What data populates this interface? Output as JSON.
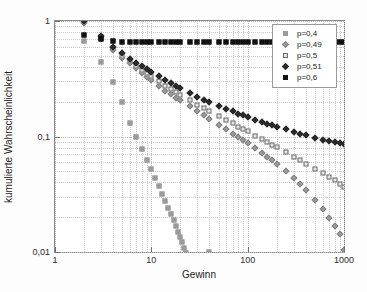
{
  "chart_data": {
    "type": "scatter",
    "title": "",
    "xlabel": "Gewinn",
    "ylabel": "kumulierte Wahrscheinlichkeit",
    "xscale": "log",
    "yscale": "log",
    "xlim": [
      1,
      1000
    ],
    "ylim": [
      0.01,
      1
    ],
    "grid": true,
    "legend_position": "top-right",
    "xticks": [
      "1",
      "10",
      "100",
      "1000"
    ],
    "xtick_values": [
      1,
      10,
      100,
      1000
    ],
    "yticks": [
      "1",
      "0,1",
      "0,01"
    ],
    "ytick_values": [
      1,
      0.1,
      0.01
    ],
    "series": [
      {
        "name": "p=0,4",
        "marker": "square",
        "color": "#9a9a9a",
        "fill": "#9a9a9a",
        "x": [
          2,
          3,
          4,
          5,
          6,
          7,
          8,
          9,
          10,
          11,
          12,
          13,
          14,
          15,
          16,
          17,
          18,
          19,
          20,
          21,
          22,
          23,
          24,
          25,
          26,
          27,
          28,
          29,
          30,
          31,
          32,
          33,
          34,
          35,
          36,
          37,
          38,
          39,
          40
        ],
        "y": [
          0.667,
          0.444,
          0.296,
          0.198,
          0.132,
          0.1,
          0.078,
          0.063,
          0.052,
          0.0437,
          0.0372,
          0.032,
          0.0277,
          0.0242,
          0.0213,
          0.0188,
          0.0167,
          0.0149,
          0.0134,
          0.0121,
          0.0109,
          0.00985,
          0.00893,
          0.00811,
          0.00738,
          0.00672,
          0.00613,
          0.0056,
          0.00512,
          0.00469,
          0.0043,
          0.00394,
          0.00362,
          0.00333,
          0.00306,
          0.00282,
          0.0026,
          0.0024,
          0.01
        ]
      },
      {
        "name": "p=0,49",
        "marker": "diamond",
        "color": "#808080",
        "fill": "#9d9d9d",
        "x": [
          2,
          3,
          4,
          5,
          6,
          7,
          8,
          9,
          10,
          12,
          14,
          16,
          18,
          20,
          25,
          30,
          35,
          40,
          50,
          60,
          70,
          80,
          90,
          100,
          120,
          140,
          160,
          180,
          200,
          250,
          300,
          350,
          400,
          500,
          600,
          700,
          800,
          900,
          1000
        ],
        "y": [
          0.96,
          0.7,
          0.56,
          0.48,
          0.43,
          0.39,
          0.355,
          0.33,
          0.31,
          0.275,
          0.25,
          0.232,
          0.217,
          0.205,
          0.182,
          0.165,
          0.153,
          0.143,
          0.127,
          0.115,
          0.106,
          0.099,
          0.093,
          0.088,
          0.079,
          0.072,
          0.066,
          0.062,
          0.058,
          0.05,
          0.0435,
          0.0385,
          0.0345,
          0.028,
          0.0235,
          0.0198,
          0.0168,
          0.0143,
          0.0105
        ]
      },
      {
        "name": "p=0,5",
        "marker": "square",
        "color": "#6d6d6d",
        "fill": "#e6e6e6",
        "x": [
          2,
          3,
          4,
          5,
          6,
          7,
          8,
          9,
          10,
          12,
          14,
          16,
          18,
          20,
          25,
          30,
          35,
          40,
          50,
          60,
          70,
          80,
          90,
          100,
          120,
          140,
          160,
          180,
          200,
          250,
          300,
          350,
          400,
          500,
          600,
          700,
          800,
          900,
          1000
        ],
        "y": [
          1.0,
          0.72,
          0.58,
          0.5,
          0.448,
          0.41,
          0.378,
          0.353,
          0.333,
          0.3,
          0.275,
          0.257,
          0.242,
          0.229,
          0.205,
          0.188,
          0.176,
          0.166,
          0.15,
          0.139,
          0.13,
          0.122,
          0.116,
          0.111,
          0.102,
          0.095,
          0.09,
          0.085,
          0.081,
          0.073,
          0.067,
          0.062,
          0.058,
          0.052,
          0.048,
          0.045,
          0.042,
          0.039,
          0.0365
        ]
      },
      {
        "name": "p=0,51",
        "marker": "diamond",
        "color": "#2a2a2a",
        "fill": "#2a2a2a",
        "x": [
          2,
          3,
          4,
          5,
          6,
          7,
          8,
          9,
          10,
          12,
          14,
          16,
          18,
          20,
          25,
          30,
          35,
          40,
          50,
          60,
          70,
          80,
          90,
          100,
          120,
          140,
          160,
          180,
          200,
          250,
          300,
          350,
          400,
          500,
          600,
          700,
          800,
          900,
          1000
        ],
        "y": [
          1.0,
          0.735,
          0.6,
          0.525,
          0.472,
          0.435,
          0.405,
          0.382,
          0.362,
          0.331,
          0.307,
          0.289,
          0.274,
          0.262,
          0.238,
          0.221,
          0.209,
          0.199,
          0.184,
          0.173,
          0.165,
          0.158,
          0.153,
          0.148,
          0.14,
          0.134,
          0.129,
          0.125,
          0.122,
          0.115,
          0.11,
          0.106,
          0.103,
          0.098,
          0.094,
          0.092,
          0.089,
          0.087,
          0.0855
        ]
      },
      {
        "name": "p=0,6",
        "marker": "square",
        "color": "#111111",
        "fill": "#111111",
        "x": [
          2,
          3,
          4,
          5,
          6,
          7,
          8,
          9,
          10,
          12,
          14,
          16,
          18,
          20,
          25,
          30,
          35,
          40,
          50,
          60,
          70,
          80,
          90,
          100,
          120,
          140,
          160,
          180,
          200,
          250,
          300,
          350,
          400,
          500,
          600,
          700,
          800,
          900,
          1000
        ],
        "y": [
          0.75,
          0.695,
          0.672,
          0.662,
          0.658,
          0.656,
          0.655,
          0.6545,
          0.654,
          0.6535,
          0.6533,
          0.6532,
          0.6531,
          0.653,
          0.653,
          0.653,
          0.653,
          0.653,
          0.653,
          0.653,
          0.653,
          0.653,
          0.653,
          0.653,
          0.653,
          0.653,
          0.653,
          0.653,
          0.653,
          0.653,
          0.653,
          0.653,
          0.653,
          0.653,
          0.653,
          0.653,
          0.653,
          0.653,
          0.653
        ]
      }
    ]
  }
}
